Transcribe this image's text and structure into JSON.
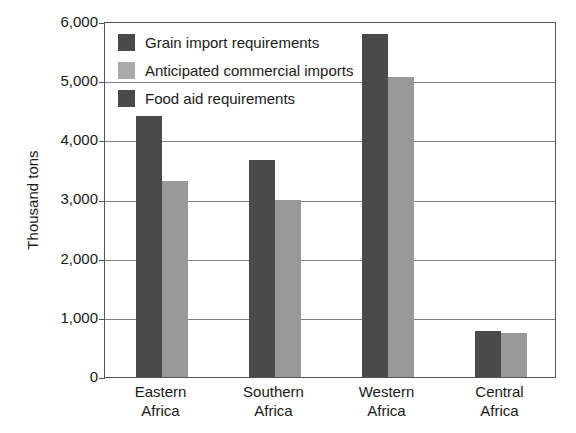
{
  "chart_data": {
    "type": "bar",
    "title": "",
    "subtitle": "",
    "xlabel": "",
    "ylabel": "Thousand tons",
    "ylim": [
      0,
      6000
    ],
    "ytick_labels": [
      "6,000",
      "5,000",
      "4,000",
      "3,000",
      "2,000",
      "1,000",
      "0"
    ],
    "ytick_values": [
      6000,
      5000,
      4000,
      3000,
      2000,
      1000,
      0
    ],
    "grid": true,
    "grid_axis": "y",
    "legend_position": "inside-top-left",
    "categories": [
      "Eastern Africa",
      "Southern Africa",
      "Western Africa",
      "Central Africa"
    ],
    "category_lines": [
      [
        "Eastern",
        "Africa"
      ],
      [
        "Southern",
        "Africa"
      ],
      [
        "Western",
        "Africa"
      ],
      [
        "Central",
        "Africa"
      ]
    ],
    "series": [
      {
        "name": "Grain import requirements",
        "color": "#4a4a4a",
        "values": [
          4400,
          3650,
          5780,
          770
        ]
      },
      {
        "name": "Anticipated commercial imports",
        "color": "#999999",
        "values": [
          3300,
          2990,
          5060,
          750
        ]
      },
      {
        "name": "Food aid requirements",
        "color": "#4a4a4a",
        "values": [
          1100,
          660,
          720,
          20
        ]
      }
    ]
  },
  "legend": {
    "items": [
      {
        "label": "Grain import requirements",
        "color": "#4a4a4a"
      },
      {
        "label": "Anticipated commercial imports",
        "color": "#aaaaaa"
      },
      {
        "label": "Food aid requirements",
        "color": "#4a4a4a"
      }
    ]
  },
  "axis": {
    "y_title": "Thousand tons",
    "y_labels": {
      "t6000": "6,000",
      "t5000": "5,000",
      "t4000": "4,000",
      "t3000": "3,000",
      "t2000": "2,000",
      "t1000": "1,000",
      "t0": "0"
    },
    "x_labels": [
      {
        "line1": "Eastern",
        "line2": "Africa"
      },
      {
        "line1": "Southern",
        "line2": "Africa"
      },
      {
        "line1": "Western",
        "line2": "Africa"
      },
      {
        "line1": "Central",
        "line2": "Africa"
      }
    ]
  },
  "colors": {
    "grain": "#4a4a4a",
    "commercial": "#999999",
    "axis": "#555555",
    "gridline": "#808080",
    "background": "#ffffff"
  }
}
